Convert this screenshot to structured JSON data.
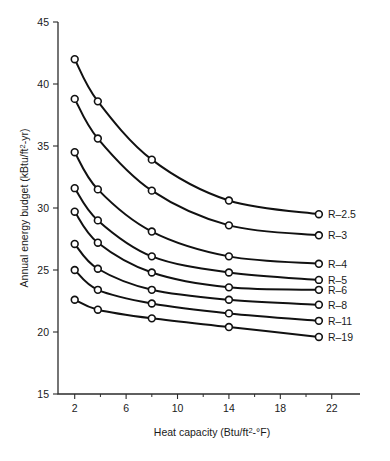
{
  "chart_data": {
    "type": "line",
    "title": "",
    "xlabel": "Heat capacity (Btu/ft2-°F)",
    "xlabel_parts": {
      "pre": "Heat capacity (Btu/ft",
      "sup": "2",
      "post": "-°F)"
    },
    "ylabel": "Annual energy budget (kBtu/ft2-yr)",
    "ylabel_parts": {
      "pre": "Annual energy budget (kBtu/ft",
      "sup": "2",
      "post": "-yr)"
    },
    "xlim": [
      0.7,
      24.2
    ],
    "ylim": [
      15,
      45
    ],
    "xticks": [
      2,
      6,
      10,
      14,
      18,
      22
    ],
    "xticklabels": [
      "2",
      "6",
      "10",
      "14",
      "18",
      "22"
    ],
    "xticks_minor": [
      4,
      8,
      12,
      16,
      20
    ],
    "yticks": [
      15,
      20,
      25,
      30,
      35,
      40,
      45
    ],
    "yticklabels": [
      "15",
      "20",
      "25",
      "30",
      "35",
      "40",
      "45"
    ],
    "grid": false,
    "legend_position": "right-inline-at-line-end",
    "marker": "open-circle",
    "line_color": "#111111",
    "marker_face_color": "#ffffff",
    "x": [
      2,
      3.8,
      8,
      14,
      21
    ],
    "series": [
      {
        "name": "R-2.5",
        "label": "R–2.5",
        "values": [
          42.0,
          38.6,
          33.9,
          30.6,
          29.5
        ]
      },
      {
        "name": "R-3",
        "label": "R–3",
        "values": [
          38.8,
          35.6,
          31.4,
          28.6,
          27.8
        ]
      },
      {
        "name": "R-4",
        "label": "R–4",
        "values": [
          34.5,
          31.5,
          28.1,
          26.1,
          25.5
        ]
      },
      {
        "name": "R-5",
        "label": "R–5",
        "values": [
          31.6,
          29.0,
          26.1,
          24.8,
          24.2
        ]
      },
      {
        "name": "R-6",
        "label": "R–6",
        "values": [
          29.7,
          27.2,
          24.8,
          23.6,
          23.4
        ]
      },
      {
        "name": "R-8",
        "label": "R–8",
        "values": [
          27.1,
          25.1,
          23.4,
          22.6,
          22.2
        ]
      },
      {
        "name": "R-11",
        "label": "R–11",
        "values": [
          25.0,
          23.4,
          22.3,
          21.5,
          20.9
        ]
      },
      {
        "name": "R-19",
        "label": "R–19",
        "values": [
          22.6,
          21.8,
          21.1,
          20.4,
          19.6
        ]
      }
    ]
  }
}
